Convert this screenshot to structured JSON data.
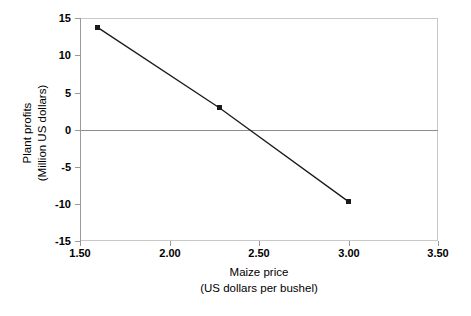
{
  "chart": {
    "title": "",
    "xlabel_line1": "Maize price",
    "xlabel_line2": "(US dollars per bushel)",
    "ylabel_line1": "Plant profits",
    "ylabel_line2": "(Million US dollars)",
    "line_color": "#1a1a1a",
    "frame_color": "#c9c9c9",
    "zero_line_color": "#8c8c8c"
  },
  "chart_data": {
    "type": "line",
    "title": "",
    "xlabel": "Maize price (US dollars per bushel)",
    "ylabel": "Plant profits (Million US dollars)",
    "xlim": [
      1.5,
      3.5
    ],
    "ylim": [
      -15,
      15
    ],
    "xticks": [
      "1.50",
      "2.00",
      "2.50",
      "3.00",
      "3.50"
    ],
    "xtick_values": [
      1.5,
      2.0,
      2.5,
      3.0,
      3.5
    ],
    "yticks": [
      "15",
      "10",
      "5",
      "0",
      "-5",
      "-10",
      "-15"
    ],
    "ytick_values": [
      15,
      10,
      5,
      0,
      -5,
      -10,
      -15
    ],
    "grid": false,
    "legend": "none",
    "zero_reference_line": 0,
    "series": [
      {
        "name": "Plant profits",
        "marker": "square",
        "x": [
          1.6,
          2.28,
          3.0
        ],
        "y": [
          13.7,
          2.9,
          -9.7
        ],
        "points": [
          {
            "x": 1.6,
            "y": 13.7
          },
          {
            "x": 2.28,
            "y": 2.9
          },
          {
            "x": 3.0,
            "y": -9.7
          }
        ]
      }
    ]
  }
}
